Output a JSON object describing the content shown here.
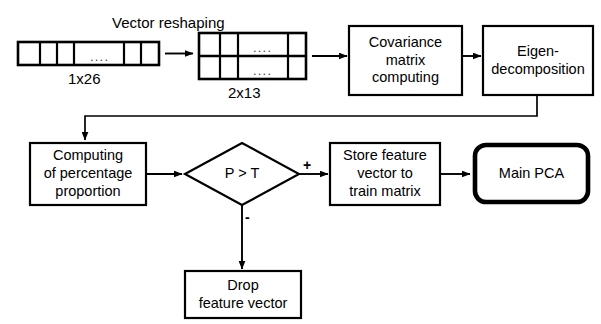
{
  "diagram": {
    "type": "flowchart",
    "title_caption": "Vector reshaping",
    "vectors": [
      {
        "id": "input-vector",
        "label": "1x26",
        "dots": "....",
        "cells_before_dots": 3,
        "cells_after_dots": 2,
        "rows": 1
      },
      {
        "id": "reshaped-matrix",
        "label": "2x13",
        "dots": "....",
        "cells_before_dots": 2,
        "cells_after_dots": 1,
        "rows": 2
      }
    ],
    "nodes": [
      {
        "id": "covariance",
        "shape": "rect",
        "label": "Covariance\nmatrix\ncomputing"
      },
      {
        "id": "eigen",
        "shape": "rect",
        "label": "Eigen-\ndecomposition"
      },
      {
        "id": "percentage",
        "shape": "rect",
        "label": "Computing\nof percentage\nproportion"
      },
      {
        "id": "decision",
        "shape": "diamond",
        "label": "P > T"
      },
      {
        "id": "store",
        "shape": "rect",
        "label": "Store feature\nvector to\ntrain matrix"
      },
      {
        "id": "main-pca",
        "shape": "rounded-rect-thick",
        "label": "Main PCA"
      },
      {
        "id": "drop",
        "shape": "rect",
        "label": "Drop\nfeature vector"
      }
    ],
    "edge_labels": {
      "positive": "+",
      "negative": "-"
    },
    "colors": {
      "stroke": "#000000",
      "fill": "#ffffff",
      "text": "#000000"
    }
  }
}
